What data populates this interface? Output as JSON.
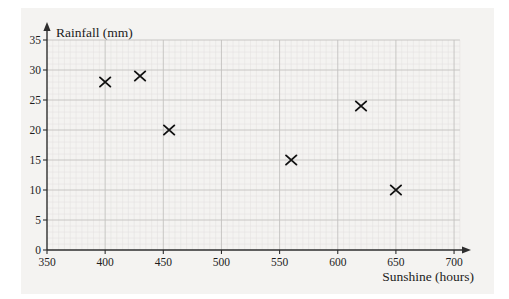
{
  "figure": {
    "background_color": "#ffffff",
    "paper_color": "#f4f3f1",
    "grid_minor_color": "#e3e2df",
    "grid_major_color": "#c3c2bf",
    "axis_color": "#2e2e2e",
    "text_color": "#1c1c1c",
    "marker_color": "#111111"
  },
  "chart_data": {
    "type": "scatter",
    "title": "",
    "xlabel": "Sunshine (hours)",
    "ylabel": "Rainfall (mm)",
    "xlim": [
      350,
      705
    ],
    "ylim": [
      0,
      35
    ],
    "xticks": [
      350,
      400,
      450,
      500,
      550,
      600,
      650,
      700
    ],
    "yticks": [
      0,
      5,
      10,
      15,
      20,
      25,
      30,
      35
    ],
    "x_minor_step": 5,
    "y_minor_step": 1,
    "grid": "on",
    "legend": "none",
    "marker": "x",
    "points": [
      {
        "x": 400,
        "y": 28
      },
      {
        "x": 430,
        "y": 29
      },
      {
        "x": 455,
        "y": 20
      },
      {
        "x": 560,
        "y": 15
      },
      {
        "x": 620,
        "y": 24
      },
      {
        "x": 650,
        "y": 10
      }
    ]
  }
}
